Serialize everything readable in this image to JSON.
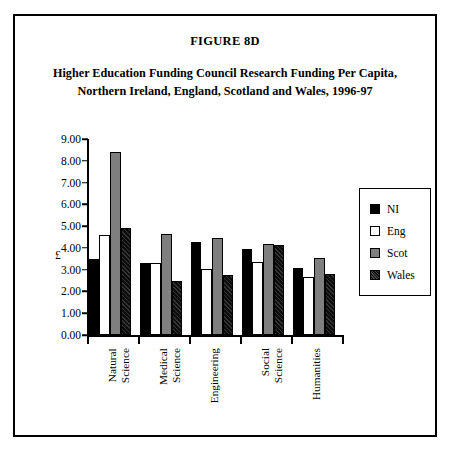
{
  "figure": {
    "number": "FIGURE 8D",
    "title_line_1": "Higher Education Funding Council Research Funding Per Capita,",
    "title_line_2": "Northern Ireland, England, Scotland and Wales, 1996-97"
  },
  "chart_data": {
    "type": "bar",
    "title": "Higher Education Funding Council Research Funding Per Capita, Northern Ireland, England, Scotland and Wales, 1996-97",
    "xlabel": "",
    "ylabel": "£",
    "ylim": [
      0,
      9
    ],
    "ytick_step": 1,
    "ytick_labels": [
      "0.00",
      "1.00",
      "2.00",
      "3.00",
      "4.00",
      "5.00",
      "6.00",
      "7.00",
      "8.00",
      "9.00"
    ],
    "grid": false,
    "legend_position": "right",
    "categories": [
      "Natural Science",
      "Medical Science",
      "Engineering",
      "Social Science",
      "Humanities"
    ],
    "series": [
      {
        "name": "NI",
        "color": "#000000",
        "values": [
          3.5,
          3.3,
          4.25,
          3.95,
          3.1
        ]
      },
      {
        "name": "Eng",
        "color": "#ffffff",
        "values": [
          4.6,
          3.3,
          3.05,
          3.35,
          2.65
        ]
      },
      {
        "name": "Scot",
        "color": "#7f7f7f",
        "values": [
          8.4,
          4.65,
          4.45,
          4.2,
          3.55
        ]
      },
      {
        "name": "Wales",
        "color": "#0d0d0d",
        "values": [
          4.9,
          2.5,
          2.75,
          4.15,
          2.8
        ]
      }
    ]
  }
}
